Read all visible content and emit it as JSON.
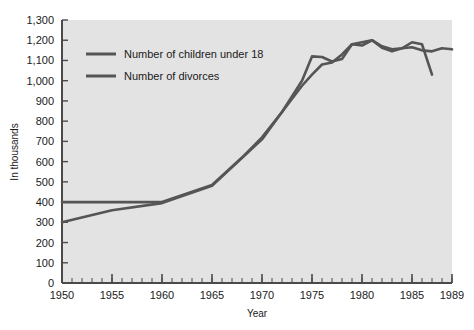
{
  "chart_data": {
    "type": "line",
    "title": "",
    "xlabel": "Year",
    "ylabel": "In thousands",
    "xlim": [
      1950,
      1989
    ],
    "ylim": [
      0,
      1300
    ],
    "grid": false,
    "legend_position": "top-left",
    "xticks": [
      "1950",
      "1955",
      "1960",
      "1965",
      "1970",
      "1975",
      "1980",
      "1985",
      "1989"
    ],
    "xtick_values": [
      1950,
      1955,
      1960,
      1965,
      1970,
      1975,
      1980,
      1985,
      1989
    ],
    "xminor_step": 1,
    "yticks": [
      "0",
      "100",
      "200",
      "300",
      "400",
      "500",
      "600",
      "700",
      "800",
      "900",
      "1,000",
      "1,100",
      "1,200",
      "1,300"
    ],
    "ytick_values": [
      0,
      100,
      200,
      300,
      400,
      500,
      600,
      700,
      800,
      900,
      1000,
      1100,
      1200,
      1300
    ],
    "series": [
      {
        "name": "Number of children under 18",
        "color": "#555555",
        "x": [
          1950,
          1955,
          1960,
          1965,
          1968,
          1970,
          1972,
          1974,
          1975,
          1976,
          1977,
          1978,
          1979,
          1980,
          1981,
          1982,
          1983,
          1984,
          1985,
          1986,
          1987,
          1988,
          1989
        ],
        "values": [
          400,
          400,
          400,
          485,
          620,
          720,
          845,
          1000,
          1120,
          1117,
          1095,
          1107,
          1180,
          1174,
          1200,
          1163,
          1145,
          1160,
          1165,
          1150,
          1145,
          1160,
          1155
        ]
      },
      {
        "name": "Number of divorces",
        "color": "#555555",
        "x": [
          1950,
          1955,
          1960,
          1965,
          1970,
          1972,
          1974,
          1975,
          1976,
          1977,
          1978,
          1979,
          1980,
          1981,
          1982,
          1983,
          1984,
          1985,
          1986,
          1987
        ],
        "values": [
          300,
          360,
          395,
          480,
          710,
          845,
          975,
          1030,
          1080,
          1090,
          1130,
          1180,
          1190,
          1200,
          1170,
          1155,
          1160,
          1190,
          1180,
          1030
        ]
      }
    ]
  },
  "legend": {
    "items": [
      {
        "label": "Number of children under 18"
      },
      {
        "label": "Number of divorces"
      }
    ]
  },
  "axes": {
    "y_axis_label": "In thousands",
    "x_axis_label": "Year"
  },
  "colors": {
    "plot_background": "#e3e3e3",
    "page_background": "#ffffff",
    "line": "#555555",
    "axis": "#4a4a4a",
    "text": "#1a1a1a"
  }
}
